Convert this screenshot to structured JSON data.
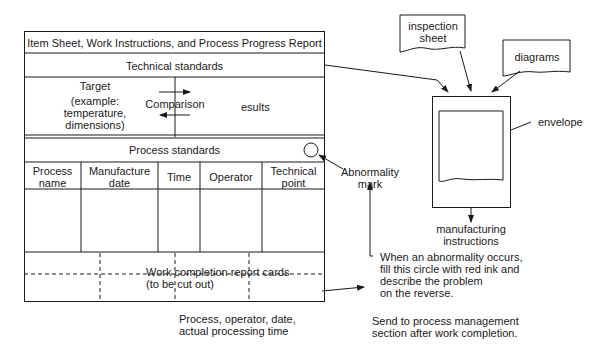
{
  "sheet": {
    "title": "Item Sheet, Work Instructions, and Process Progress Report",
    "technical_standards": "Technical standards",
    "target_label": "Target",
    "target_example": [
      "(example:",
      "temperature,",
      "dimensions)"
    ],
    "comparison_label": "Comparison",
    "results_label": "esults",
    "process_standards": "Process standards",
    "columns": [
      {
        "line1": "Process",
        "line2": "name"
      },
      {
        "line1": "Manufacture",
        "line2": "date"
      },
      {
        "line1": "Time",
        "line2": ""
      },
      {
        "line1": "Operator",
        "line2": ""
      },
      {
        "line1": "Technical",
        "line2": "point"
      }
    ],
    "cards_label": [
      "Work completion report cards",
      "(to be cut out)"
    ],
    "card_fields": [
      "Process, operator, date,",
      "actual processing time"
    ]
  },
  "annotations": {
    "abnormality_mark": [
      "Abnormality",
      "mark"
    ],
    "abnormality_note": [
      "When an abnormality occurs,",
      "fill this circle with red ink and",
      "describe the problem",
      "on the reverse."
    ],
    "send_note": [
      "Send to process management",
      "section after work completion."
    ]
  },
  "envelope": {
    "inspection_sheet": [
      "inspection",
      "sheet"
    ],
    "diagrams": "diagrams",
    "envelope_label": "envelope",
    "manufacturing_instructions": [
      "manufacturing",
      "instructions"
    ]
  }
}
